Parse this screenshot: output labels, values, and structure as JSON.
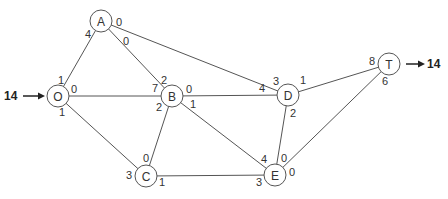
{
  "diagram": {
    "type": "flow-network",
    "source": {
      "node": "O",
      "inflow": "14"
    },
    "sink": {
      "node": "T",
      "outflow": "14"
    },
    "nodes": [
      {
        "id": "O",
        "label": "O",
        "x": 58,
        "y": 96
      },
      {
        "id": "A",
        "label": "A",
        "x": 101,
        "y": 21
      },
      {
        "id": "B",
        "label": "B",
        "x": 172,
        "y": 96
      },
      {
        "id": "C",
        "label": "C",
        "x": 146,
        "y": 176
      },
      {
        "id": "D",
        "label": "D",
        "x": 288,
        "y": 95
      },
      {
        "id": "E",
        "label": "E",
        "x": 275,
        "y": 175
      },
      {
        "id": "T",
        "label": "T",
        "x": 389,
        "y": 64
      }
    ],
    "edges": [
      {
        "from": "O",
        "to": "A",
        "label_from": "1",
        "label_to": "4"
      },
      {
        "from": "O",
        "to": "B",
        "label_from": "0",
        "label_to": "7"
      },
      {
        "from": "O",
        "to": "C",
        "label_from": "1",
        "label_to": "3"
      },
      {
        "from": "A",
        "to": "B",
        "label_from": "0",
        "label_to": "2"
      },
      {
        "from": "A",
        "to": "D",
        "label_from": "0",
        "label_to": "3"
      },
      {
        "from": "B",
        "to": "D",
        "label_from": "0",
        "label_to": "4"
      },
      {
        "from": "B",
        "to": "C",
        "label_from": "2",
        "label_to": "0"
      },
      {
        "from": "B",
        "to": "E",
        "label_from": "1",
        "label_to": "4"
      },
      {
        "from": "C",
        "to": "E",
        "label_from": "1",
        "label_to": "3"
      },
      {
        "from": "D",
        "to": "T",
        "label_from": "1",
        "label_to": "8"
      },
      {
        "from": "D",
        "to": "E",
        "label_from": "2",
        "label_to": "0"
      },
      {
        "from": "E",
        "to": "T",
        "label_from": "0",
        "label_to": "6"
      }
    ]
  }
}
